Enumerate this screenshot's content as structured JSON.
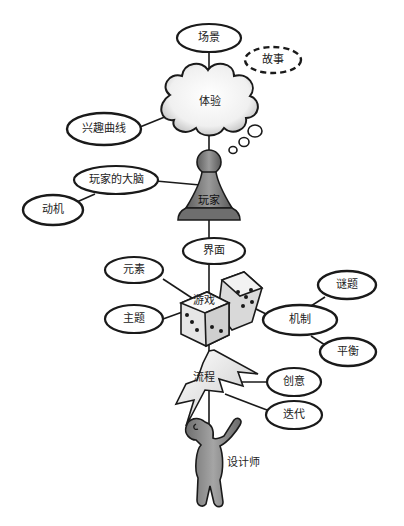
{
  "diagram": {
    "nodes": {
      "scene": "场景",
      "story": "故事",
      "experience": "体验",
      "interest_curve": "兴趣曲线",
      "player_brain": "玩家的大脑",
      "motivation": "动机",
      "player": "玩家",
      "interface": "界面",
      "elements": "元素",
      "theme": "主题",
      "game": "游戏",
      "mechanics": "机制",
      "puzzles": "谜题",
      "balance": "平衡",
      "process": "流程",
      "creativity": "创意",
      "iteration": "迭代",
      "designer": "设计师"
    },
    "colors": {
      "line": "#1a1a1a",
      "ellipse_fill": "#ffffff",
      "pawn": "#7d7d7d",
      "figure": "#8a8a8a"
    }
  }
}
